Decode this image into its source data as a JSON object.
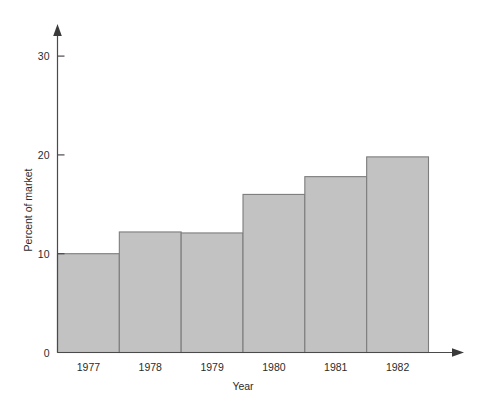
{
  "chart_data": {
    "type": "bar",
    "title": "",
    "subtitle": "",
    "xlabel": "Year",
    "ylabel": "Percent of market",
    "categories": [
      "1977",
      "1978",
      "1979",
      "1980",
      "1981",
      "1982"
    ],
    "values": [
      10,
      12.2,
      12.1,
      16,
      17.8,
      19.8
    ],
    "series": [
      {
        "name": "Percent of market",
        "values": [
          10,
          12.2,
          12.1,
          16,
          17.8,
          19.8
        ]
      }
    ],
    "ylim": [
      0,
      32
    ],
    "xlim_note": "contiguous histogram-style bars, one per year",
    "ytick_labels": [
      "0",
      "10",
      "20",
      "30"
    ],
    "ytick_values": [
      0,
      10,
      20,
      30
    ],
    "xtick_labels": [
      "1977",
      "1978",
      "1979",
      "1980",
      "1981",
      "1982"
    ],
    "grid": false,
    "legend": false,
    "legend_position": "none",
    "bar_gap": 0,
    "colors": {
      "bar_fill": "#c2c2c2",
      "bar_stroke": "#7d7d7d",
      "axis": "#4a4a4a",
      "text": "#2b2b2b",
      "background": "#ffffff"
    },
    "axis_style": {
      "y_axis_arrow": true,
      "x_axis_arrow": true,
      "tick_direction": "inward"
    }
  }
}
